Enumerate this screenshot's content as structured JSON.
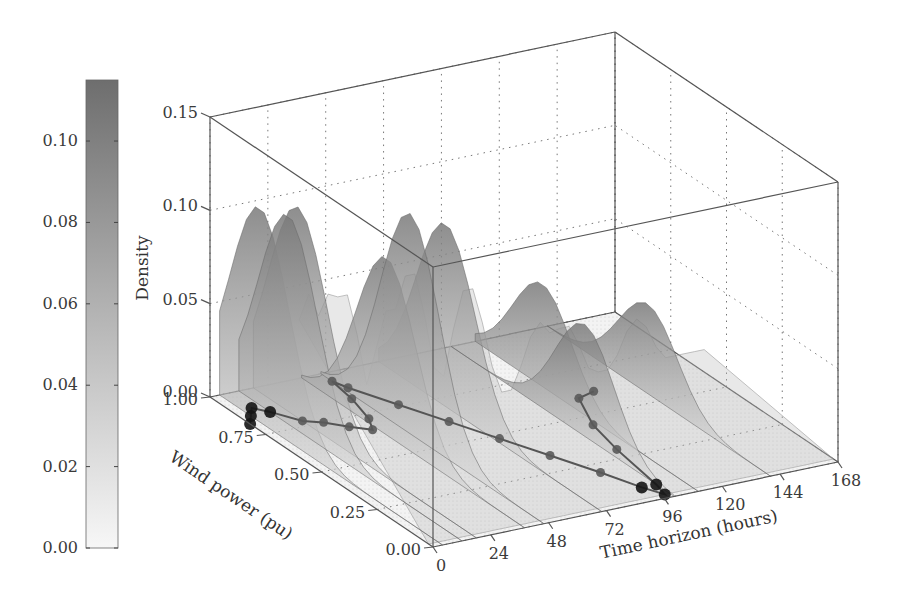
{
  "chart_data": {
    "type": "surface3d",
    "title": "",
    "axes": {
      "x": {
        "label": "Time horizon (hours)",
        "ticks": [
          0,
          24,
          48,
          72,
          96,
          120,
          144,
          168
        ],
        "range": [
          0,
          168
        ]
      },
      "y": {
        "label": "Wind power (pu)",
        "ticks": [
          0.0,
          0.25,
          0.5,
          0.75,
          1.0
        ],
        "range": [
          0,
          1
        ]
      },
      "z": {
        "label": "Density",
        "ticks": [
          0.0,
          0.05,
          0.1,
          0.15
        ],
        "range": [
          0,
          0.15
        ]
      }
    },
    "tick_labels": {
      "x": [
        "0",
        "24",
        "48",
        "72",
        "96",
        "120",
        "144",
        "168"
      ],
      "y": [
        "0.00",
        "0.25",
        "0.50",
        "0.75",
        "1.00"
      ],
      "z": [
        "0.00",
        "0.05",
        "0.10",
        "0.15"
      ]
    },
    "colorbar": {
      "ticks": [
        "0.00",
        "0.02",
        "0.04",
        "0.06",
        "0.08",
        "0.10"
      ],
      "range": [
        0,
        0.115
      ],
      "color_low": "#f4f4f4",
      "color_high": "#6e6e6e"
    },
    "surface_ridges": [
      {
        "t": 4,
        "w": 0.82,
        "peak": 0.115
      },
      {
        "t": 12,
        "w": 0.78,
        "peak": 0.112
      },
      {
        "t": 18,
        "w": 0.8,
        "peak": 0.113
      },
      {
        "t": 38,
        "w": 0.62,
        "peak": 0.095
      },
      {
        "t": 46,
        "w": 0.6,
        "peak": 0.118
      },
      {
        "t": 70,
        "w": 0.7,
        "peak": 0.098
      },
      {
        "t": 100,
        "w": 0.4,
        "peak": 0.06
      },
      {
        "t": 110,
        "w": 0.7,
        "peak": 0.055
      },
      {
        "t": 140,
        "w": 0.55,
        "peak": 0.048
      }
    ],
    "observed_wind_trajectory": {
      "description": "Observed wind power over 168-hour horizon, drawn on floor",
      "points": [
        {
          "t": 0,
          "w": 0.82
        },
        {
          "t": 4,
          "w": 0.86
        },
        {
          "t": 8,
          "w": 0.9
        },
        {
          "t": 12,
          "w": 0.86
        },
        {
          "t": 18,
          "w": 0.78
        },
        {
          "t": 24,
          "w": 0.75
        },
        {
          "t": 30,
          "w": 0.7
        },
        {
          "t": 36,
          "w": 0.66
        },
        {
          "t": 40,
          "w": 0.72
        },
        {
          "t": 44,
          "w": 0.84
        },
        {
          "t": 46,
          "w": 0.95
        },
        {
          "t": 48,
          "w": 0.9
        },
        {
          "t": 56,
          "w": 0.76
        },
        {
          "t": 64,
          "w": 0.62
        },
        {
          "t": 72,
          "w": 0.48
        },
        {
          "t": 80,
          "w": 0.34
        },
        {
          "t": 88,
          "w": 0.2
        },
        {
          "t": 94,
          "w": 0.08
        },
        {
          "t": 98,
          "w": 0.02
        },
        {
          "t": 100,
          "w": 0.08
        },
        {
          "t": 104,
          "w": 0.3
        },
        {
          "t": 108,
          "w": 0.45
        },
        {
          "t": 116,
          "w": 0.6
        },
        {
          "t": 124,
          "w": 0.62
        }
      ]
    }
  }
}
